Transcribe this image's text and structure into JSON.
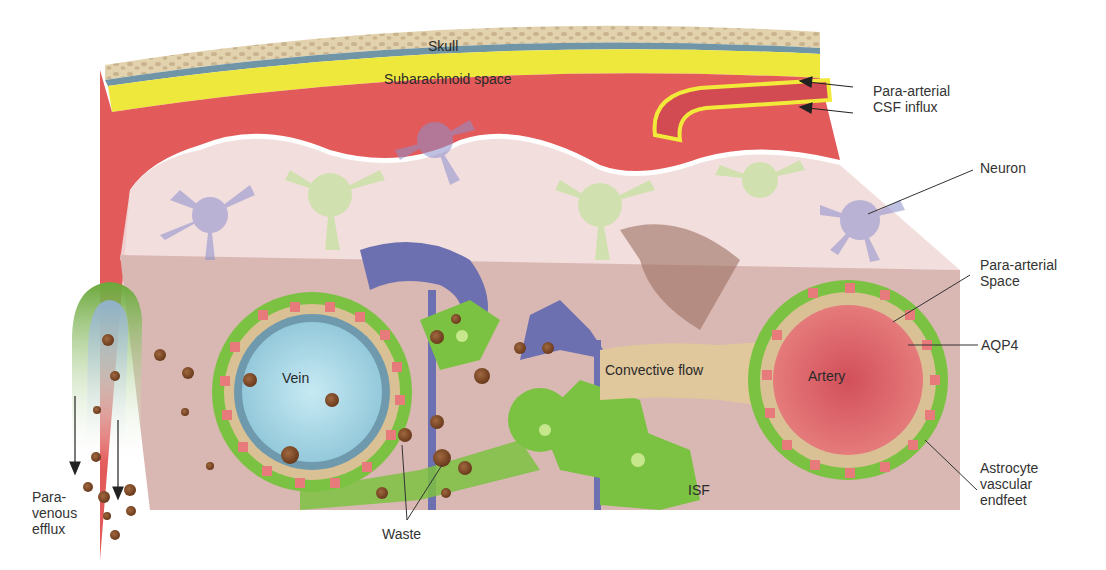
{
  "diagram": {
    "layers": {
      "skull": "Skull",
      "subarachnoid": "Subarachnoid space",
      "isf": "ISF"
    },
    "vessels": {
      "vein": "Vein",
      "artery": "Artery"
    },
    "flow": {
      "convective": "Convective flow"
    },
    "callouts": {
      "paraarterial_influx": "Para-arterial\nCSF influx",
      "neuron": "Neuron",
      "paraarterial_space": "Para-arterial\nSpace",
      "aqp4": "AQP4",
      "endfeet": "Astrocyte\nvascular\nendfeet",
      "paravenous_efflux": "Para-\nvenous\nefflux",
      "waste": "Waste"
    },
    "colors": {
      "skull": "#d9c7a4",
      "subarachnoid": "#f2ea3a",
      "pia": "#6f95a6",
      "cortex_red": "#e35a5a",
      "tissue_pink": "#dcb9b5",
      "astrocyte_green": "#7cc242",
      "neuron_purple": "#6c6fb0",
      "vein_blue": "#a9d8e6",
      "artery_red": "#d94a55",
      "waste_brown": "#7a4523",
      "aqp4_pink": "#e77b7b"
    }
  }
}
